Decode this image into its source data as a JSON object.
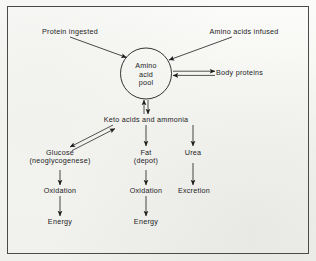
{
  "figure": {
    "type": "flow-diagram",
    "border_color": "#4a4a4a",
    "ink_color": "#1c1c1c",
    "paper_color": "#f7f7f4"
  },
  "nodes": {
    "protein_ingested": "Protein ingested",
    "amino_acids_infused": "Amino acids infused",
    "amino_acid_pool_line1": "Amino",
    "amino_acid_pool_line2": "acid",
    "amino_acid_pool_line3": "pool",
    "body_proteins": "Body proteins",
    "keto_acids": "Keto acids and ammonia",
    "glucose_line1": "Glucose",
    "glucose_line2": "(neoglycogenese)",
    "fat_line1": "Fat",
    "fat_line2": "(depot)",
    "urea": "Urea",
    "oxidation_left": "Oxidation",
    "oxidation_middle": "Oxidation",
    "excretion": "Excretion",
    "energy_left": "Energy",
    "energy_middle": "Energy"
  },
  "edges": [
    {
      "name": "protein-ingested-to-pool",
      "from": "Protein ingested",
      "to": "Amino acid pool",
      "style": "single",
      "direction": "one-way"
    },
    {
      "name": "amino-acids-infused-to-pool",
      "from": "Amino acids infused",
      "to": "Amino acid pool",
      "style": "single",
      "direction": "one-way"
    },
    {
      "name": "pool-to-body-proteins",
      "from": "Amino acid pool",
      "to": "Body proteins",
      "style": "double",
      "direction": "reversible"
    },
    {
      "name": "pool-to-keto-acids",
      "from": "Amino acid pool",
      "to": "Keto acids and ammonia",
      "style": "double",
      "direction": "reversible"
    },
    {
      "name": "keto-acids-to-glucose",
      "from": "Keto acids and ammonia",
      "to": "Glucose (neoglycogenese)",
      "style": "double",
      "direction": "reversible"
    },
    {
      "name": "keto-acids-to-fat",
      "from": "Keto acids and ammonia",
      "to": "Fat (depot)",
      "style": "single",
      "direction": "one-way"
    },
    {
      "name": "keto-acids-to-urea",
      "from": "Keto acids and ammonia",
      "to": "Urea",
      "style": "single",
      "direction": "one-way"
    },
    {
      "name": "glucose-to-oxidation",
      "from": "Glucose (neoglycogenese)",
      "to": "Oxidation",
      "style": "single",
      "direction": "one-way"
    },
    {
      "name": "fat-to-oxidation",
      "from": "Fat (depot)",
      "to": "Oxidation",
      "style": "single",
      "direction": "one-way"
    },
    {
      "name": "urea-to-excretion",
      "from": "Urea",
      "to": "Excretion",
      "style": "single",
      "direction": "one-way"
    },
    {
      "name": "oxidation-left-to-energy",
      "from": "Oxidation",
      "to": "Energy",
      "style": "single",
      "direction": "one-way"
    },
    {
      "name": "oxidation-middle-to-energy",
      "from": "Oxidation",
      "to": "Energy",
      "style": "single",
      "direction": "one-way"
    }
  ]
}
